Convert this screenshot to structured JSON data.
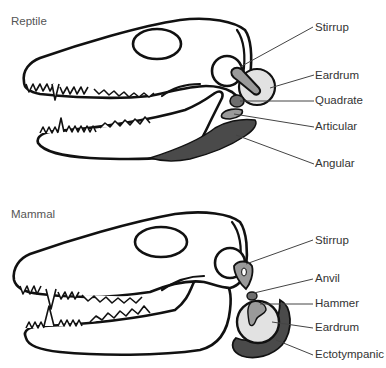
{
  "figure": {
    "panels": [
      {
        "title": "Reptile",
        "labels": [
          "Stirrup",
          "Eardrum",
          "Quadrate",
          "Articular",
          "Angular"
        ]
      },
      {
        "title": "Mammal",
        "labels": [
          "Stirrup",
          "Anvil",
          "Hammer",
          "Eardrum",
          "Ectotympanic"
        ]
      }
    ],
    "colors": {
      "outline": "#111111",
      "eardrum_fill": "#e2e2e2",
      "light_bone": "#9a9a9a",
      "mid_bone": "#6e6e6e",
      "dark_bone": "#4a4a4a",
      "leader_line": "#444444",
      "label_text": "#333333"
    }
  }
}
